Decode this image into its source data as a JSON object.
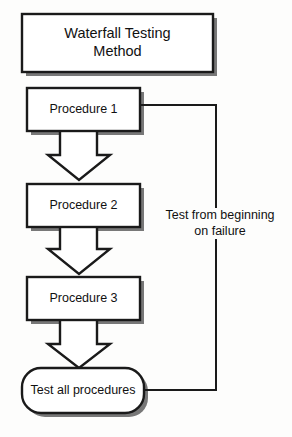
{
  "diagram": {
    "type": "flowchart",
    "orientation": "top-to-bottom",
    "background_color": "#fdfdfc",
    "stroke_color": "#1a1a1a",
    "shadow_color": "#6e6e6e",
    "fill_color": "#ffffff",
    "title_box": {
      "label": "Waterfall Testing\nMethod",
      "shape": "rectangle",
      "x": 22,
      "y": 14,
      "w": 191,
      "h": 58
    },
    "nodes": [
      {
        "id": "procedure-1",
        "label": "Procedure 1",
        "shape": "rectangle",
        "x": 27,
        "y": 88,
        "w": 113,
        "h": 43
      },
      {
        "id": "procedure-2",
        "label": "Procedure 2",
        "shape": "rectangle",
        "x": 27,
        "y": 184,
        "w": 113,
        "h": 43
      },
      {
        "id": "procedure-3",
        "label": "Procedure 3",
        "shape": "rectangle",
        "x": 27,
        "y": 277,
        "w": 113,
        "h": 43
      },
      {
        "id": "test-all-procedures",
        "label": "Test all procedures",
        "shape": "rounded-rectangle",
        "x": 22,
        "y": 368,
        "w": 122,
        "h": 45
      }
    ],
    "block_arrows": [
      {
        "id": "arrow-proc1-to-proc2",
        "from": "procedure-1",
        "to": "procedure-2",
        "direction": "down"
      },
      {
        "id": "arrow-proc2-to-proc3",
        "from": "procedure-2",
        "to": "procedure-3",
        "direction": "down"
      },
      {
        "id": "arrow-proc3-to-test",
        "from": "procedure-3",
        "to": "test-all-procedures",
        "direction": "down"
      }
    ],
    "feedback_edge": {
      "id": "feedback-loop",
      "from": "test-all-procedures",
      "to": "procedure-1",
      "label": "Test from beginning\non failure",
      "label_x": 155,
      "label_y": 208,
      "label_w": 130,
      "arrowhead": "left"
    }
  }
}
